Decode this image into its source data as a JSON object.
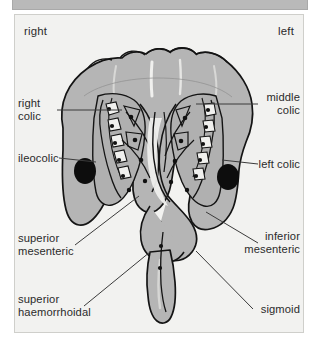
{
  "figure": {
    "background_color": "#f2f2f0",
    "colon_fill_color": "#b5b5b5",
    "colon_fill_dark": "#9e9e9e",
    "outline_color": "#1a1a1a",
    "node_color": "#111111",
    "top_band_color": "#b9b9b9",
    "frame_border_color": "#cfcfcb",
    "leader_line_color": "#3b3b3b"
  },
  "orientation": {
    "right_label": "right",
    "left_label": "left"
  },
  "labels": {
    "right_colic": "right\ncolic",
    "ileocolic": "ileocolic",
    "superior_mesenteric": "superior\nmesenteric",
    "superior_haemorrhoidal": "superior\nhaemorrhoidal",
    "middle_colic": "middle\ncolic",
    "left_colic": "left colic",
    "inferior_mesenteric": "inferior\nmesenteric",
    "sigmoid": "sigmoid"
  }
}
